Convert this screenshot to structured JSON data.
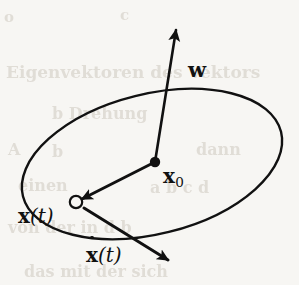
{
  "figure": {
    "background_color": "#f7f6f3",
    "ink_color": "#111111",
    "type": "vector-diagram"
  },
  "labels": {
    "axis_vector": "w",
    "center_point_symbol": "x",
    "center_point_subscript": "0",
    "position_symbol": "x",
    "position_argument": "(t)",
    "velocity_symbol": "x",
    "velocity_argument": "(t)"
  },
  "elements": {
    "orbit_name": "circular-orbit-ellipse",
    "axis_name": "rotation-axis-vector-w",
    "center_name": "center-point-x0",
    "position_name": "moving-point-x-of-t",
    "radius_name": "radius-vector-x0-to-xt",
    "velocity_name": "velocity-vector-xdot-of-t"
  },
  "geometry": {
    "ellipse": {
      "cx": 152,
      "cy": 164,
      "rx": 133,
      "ry": 70,
      "rotation_deg": -14,
      "stroke_width": 2.4
    },
    "center_dot": {
      "cx": 155,
      "cy": 162,
      "r": 5.2
    },
    "open_circle": {
      "cx": 76,
      "cy": 202,
      "r": 6.2,
      "stroke_width": 2.2
    },
    "axis_vector": {
      "x1": 155,
      "y1": 162,
      "x2": 176,
      "y2": 30,
      "stroke_width": 2.6
    },
    "radius_vector": {
      "x1": 155,
      "y1": 162,
      "x2": 82,
      "y2": 199,
      "stroke_width": 3.0
    },
    "velocity_vector": {
      "x1": 84,
      "y1": 208,
      "x2": 168,
      "y2": 260,
      "stroke_width": 3.0
    }
  },
  "ghost_text": [
    {
      "text": "Eigenvektoren des Vektors",
      "left": 6,
      "top": 62,
      "size": 17
    },
    {
      "text": "b     Drehung",
      "left": 52,
      "top": 104,
      "size": 16
    },
    {
      "text": "A",
      "left": 8,
      "top": 140,
      "size": 16
    },
    {
      "text": "b",
      "left": 52,
      "top": 142,
      "size": 16
    },
    {
      "text": "dann",
      "left": 196,
      "top": 140,
      "size": 16
    },
    {
      "text": "einen",
      "left": 18,
      "top": 176,
      "size": 16
    },
    {
      "text": "a  b  c  d",
      "left": 150,
      "top": 178,
      "size": 16
    },
    {
      "text": "von  der  in  d  b",
      "left": 8,
      "top": 218,
      "size": 16
    },
    {
      "text": "das  mit  der  sich",
      "left": 24,
      "top": 262,
      "size": 16
    },
    {
      "text": "o",
      "left": 4,
      "top": 8,
      "size": 15
    },
    {
      "text": "c",
      "left": 120,
      "top": 6,
      "size": 15
    }
  ]
}
